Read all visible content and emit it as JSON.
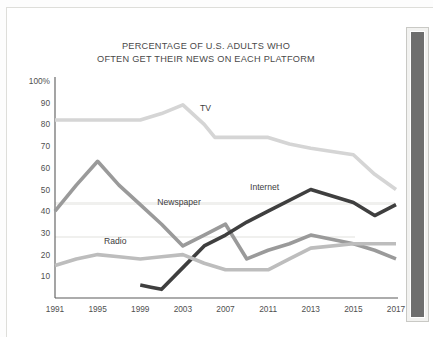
{
  "page": {
    "background_color": "#ffffff",
    "right_panel": {
      "name": "dark-side-panel",
      "color": "#6e6e6e"
    }
  },
  "chart_data": {
    "type": "line",
    "title": "PERCENTAGE OF U.S. ADULTS WHO OFTEN GET THEIR NEWS ON EACH PLATFORM",
    "title_line1": "PERCENTAGE OF U.S. ADULTS WHO",
    "title_line2": "OFTEN GET THEIR NEWS ON EACH PLATFORM",
    "xlabel": "",
    "ylabel": "",
    "ylim": [
      0,
      100
    ],
    "grid": false,
    "legend_position": "inline-labels",
    "y_ticks": [
      10,
      20,
      30,
      40,
      50,
      60,
      70,
      80,
      90,
      100
    ],
    "y_tick_labels": [
      "10",
      "20",
      "30",
      "40",
      "50",
      "60",
      "70",
      "80",
      "90",
      "100%"
    ],
    "x_tick_labels": [
      "1991",
      "1995",
      "1999",
      "2003",
      "2007",
      "2011",
      "2013",
      "2015",
      "2017"
    ],
    "x_tick_values": [
      1991,
      1995,
      1999,
      2003,
      2007,
      2011,
      2013,
      2015,
      2017
    ],
    "series": [
      {
        "name": "TV",
        "color": "#d5d5d5",
        "stroke_width": 3.6,
        "label_x": 2004.6,
        "label_y": 86,
        "points": [
          [
            1991,
            82
          ],
          [
            1993,
            82
          ],
          [
            1995,
            82
          ],
          [
            1997,
            82
          ],
          [
            1999,
            82
          ],
          [
            2001,
            85
          ],
          [
            2003,
            89
          ],
          [
            2005,
            80
          ],
          [
            2006,
            74
          ],
          [
            2008,
            74
          ],
          [
            2009,
            74
          ],
          [
            2011,
            74
          ],
          [
            2012,
            71
          ],
          [
            2013,
            69
          ],
          [
            2015,
            66
          ],
          [
            2016,
            57
          ],
          [
            2017,
            50
          ]
        ]
      },
      {
        "name": "Newspaper",
        "color": "#9a9a9a",
        "stroke_width": 3.6,
        "label_x": 2000.6,
        "label_y": 43,
        "points": [
          [
            1991,
            40
          ],
          [
            1993,
            52
          ],
          [
            1995,
            63
          ],
          [
            1997,
            52
          ],
          [
            1999,
            43
          ],
          [
            2001,
            34
          ],
          [
            2003,
            24
          ],
          [
            2005,
            29
          ],
          [
            2007,
            34
          ],
          [
            2009,
            18
          ],
          [
            2011,
            22
          ],
          [
            2012,
            25
          ],
          [
            2013,
            29
          ],
          [
            2015,
            25
          ],
          [
            2016,
            22
          ],
          [
            2017,
            18
          ]
        ]
      },
      {
        "name": "Internet",
        "color": "#3f3f3f",
        "stroke_width": 3.6,
        "label_x": 2009.3,
        "label_y": 50,
        "points": [
          [
            1999,
            6
          ],
          [
            2000,
            5
          ],
          [
            2001,
            4
          ],
          [
            2003,
            14
          ],
          [
            2005,
            24
          ],
          [
            2007,
            29
          ],
          [
            2009,
            35
          ],
          [
            2011,
            40
          ],
          [
            2013,
            50
          ],
          [
            2015,
            44
          ],
          [
            2016,
            38
          ],
          [
            2017,
            43
          ]
        ]
      },
      {
        "name": "Radio",
        "color": "#bdbdbd",
        "stroke_width": 3.6,
        "label_x": 1995.6,
        "label_y": 25,
        "points": [
          [
            1991,
            15
          ],
          [
            1993,
            18
          ],
          [
            1995,
            20
          ],
          [
            1997,
            19
          ],
          [
            1999,
            18
          ],
          [
            2001,
            19
          ],
          [
            2003,
            20
          ],
          [
            2005,
            16
          ],
          [
            2007,
            13
          ],
          [
            2009,
            13
          ],
          [
            2011,
            13
          ],
          [
            2012,
            18
          ],
          [
            2013,
            23
          ],
          [
            2015,
            25
          ],
          [
            2016,
            25
          ],
          [
            2017,
            25
          ]
        ]
      }
    ]
  }
}
